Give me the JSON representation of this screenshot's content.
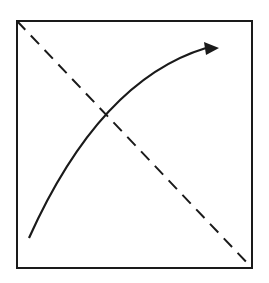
{
  "diagram": {
    "background": "#ffffff",
    "stroke_color": "#1a1a1a",
    "square": {
      "x": 17,
      "y": 21,
      "width": 235,
      "height": 247
    },
    "dashed_diagonal": {
      "from": [
        17,
        21
      ],
      "to": [
        252,
        268
      ],
      "dash": "12 8"
    },
    "curved_arrow": {
      "start": [
        29,
        238
      ],
      "control": [
        95,
        100
      ],
      "end": [
        206,
        48
      ],
      "tip": [
        219,
        48
      ]
    }
  }
}
